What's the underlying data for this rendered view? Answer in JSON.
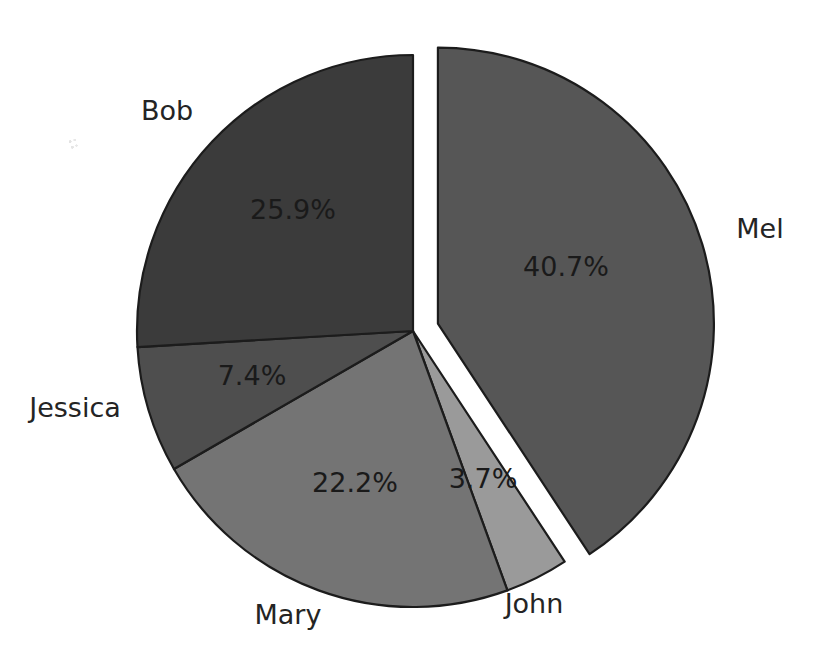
{
  "chart_data": {
    "type": "pie",
    "title": "",
    "subtitle": "",
    "xlabel": "",
    "ylabel": "",
    "legend_position": "none",
    "grid": false,
    "label_format": "percent",
    "start_angle_deg": -90,
    "direction": "clockwise",
    "categories": [
      "Mel",
      "John",
      "Mary",
      "Jessica",
      "Bob"
    ],
    "values": [
      40.7,
      3.7,
      22.2,
      22.2,
      25.9
    ],
    "slices": [
      {
        "name": "Mel",
        "label": "Mel",
        "percent_text": "40.7%",
        "value": 40.7,
        "color": "#565656",
        "exploded": true,
        "label_x": 760,
        "label_y": 230,
        "pct_x": 566,
        "pct_y": 268
      },
      {
        "name": "John",
        "label": "John",
        "percent_text": "3.7%",
        "value": 3.7,
        "color": "#9a9a9a",
        "exploded": false,
        "label_x": 534,
        "label_y": 605,
        "pct_x": 483,
        "pct_y": 480
      },
      {
        "name": "Mary",
        "label": "Mary",
        "percent_text": "22.2%",
        "value": 22.2,
        "color": "#747474",
        "exploded": false,
        "label_x": 288,
        "label_y": 616,
        "pct_x": 355,
        "pct_y": 484
      },
      {
        "name": "Jessica",
        "label": "Jessica",
        "percent_text": "7.4%",
        "value": 7.4,
        "color": "#4e4e4e",
        "exploded": false,
        "label_x": 75,
        "label_y": 409,
        "pct_x": 252,
        "pct_y": 377
      },
      {
        "name": "Bob",
        "label": "Bob",
        "percent_text": "25.9%",
        "value": 25.9,
        "color": "#3b3b3b",
        "exploded": false,
        "label_x": 167,
        "label_y": 112,
        "pct_x": 293,
        "pct_y": 211
      }
    ],
    "geometry": {
      "center_x": 413,
      "center_y": 331,
      "radius": 276,
      "explode_offset": 26,
      "outline_color": "#1c1c1c",
      "background": "#ffffff"
    }
  }
}
